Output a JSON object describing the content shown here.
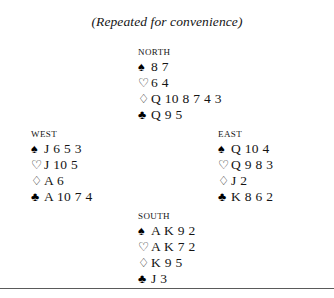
{
  "caption": "(Repeated for convenience)",
  "suit_symbols": {
    "spades": "♠",
    "hearts": "♡",
    "diamonds": "♢",
    "clubs": "♣"
  },
  "hands": {
    "north": {
      "label": "North",
      "spades": "8 7",
      "hearts": "6 4",
      "diamonds": "Q 10 8 7 4 3",
      "clubs": "Q 9 5"
    },
    "west": {
      "label": "West",
      "spades": "J 6 5 3",
      "hearts": "J 10 5",
      "diamonds": "A 6",
      "clubs": "A 10 7 4"
    },
    "east": {
      "label": "East",
      "spades": "Q 10 4",
      "hearts": "Q 9 8 3",
      "diamonds": "J 2",
      "clubs": "K 8 6 2"
    },
    "south": {
      "label": "South",
      "spades": "A K 9 2",
      "hearts": "A K 7 2",
      "diamonds": "K 9 5",
      "clubs": "J 3"
    }
  }
}
